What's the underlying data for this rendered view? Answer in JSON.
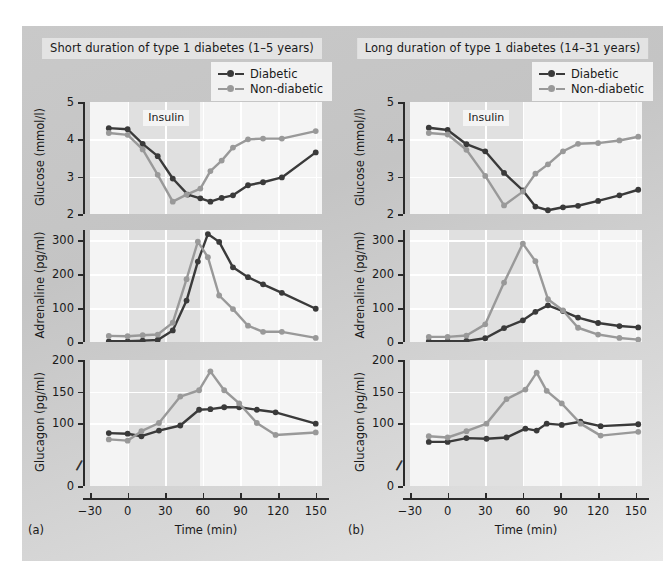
{
  "figure": {
    "background_color": "#c8c8c8",
    "plot_background": "#f4f4f4",
    "insulin_band_color": "#e0e0e0",
    "diabetic_color": "#3a3a3a",
    "nondiabetic_color": "#999999"
  },
  "panels": [
    {
      "letter": "(a)",
      "title": "Short duration of type 1 diabetes (1–5 years)",
      "legend": [
        {
          "label": "Diabetic",
          "color": "#3a3a3a",
          "name": "diabetic"
        },
        {
          "label": "Non-diabetic",
          "color": "#999999",
          "name": "non-diabetic"
        }
      ],
      "insulin_label": "Insulin",
      "xlabel": "Time (min)",
      "xticks": [
        -30,
        0,
        30,
        60,
        90,
        120,
        150
      ]
    },
    {
      "letter": "(b)",
      "title": "Long duration of type 1 diabetes (14–31 years)",
      "legend": [
        {
          "label": "Diabetic",
          "color": "#3a3a3a",
          "name": "diabetic"
        },
        {
          "label": "Non-diabetic",
          "color": "#999999",
          "name": "non-diabetic"
        }
      ],
      "insulin_label": "Insulin",
      "xlabel": "Time (min)",
      "xticks": [
        -30,
        0,
        30,
        60,
        90,
        120,
        150
      ]
    }
  ],
  "chart_data": [
    {
      "id": "a-glucose",
      "panel": "(a)",
      "type": "line",
      "title": "Short duration of type 1 diabetes (1–5 years)",
      "ylabel": "Glucose (mmol/l)",
      "xlabel": "Time (min)",
      "ylim": [
        2,
        5
      ],
      "yticks": [
        2,
        3,
        4,
        5
      ],
      "xlim": [
        -30,
        155
      ],
      "xticks": [
        -30,
        0,
        30,
        60,
        90,
        120,
        150
      ],
      "grid": true,
      "legend_position": "top-right",
      "insulin_window": [
        0,
        58
      ],
      "series": [
        {
          "name": "Diabetic",
          "color": "#3a3a3a",
          "x": [
            -15,
            0,
            12,
            24,
            36,
            48,
            58,
            66,
            75,
            84,
            96,
            108,
            123,
            150
          ],
          "values": [
            4.3,
            4.27,
            3.88,
            3.55,
            2.95,
            2.52,
            2.42,
            2.33,
            2.43,
            2.5,
            2.77,
            2.85,
            2.98,
            3.65
          ]
        },
        {
          "name": "Non-diabetic",
          "color": "#999999",
          "x": [
            -15,
            0,
            12,
            24,
            36,
            47,
            58,
            66,
            75,
            84,
            96,
            108,
            123,
            150
          ],
          "values": [
            4.17,
            4.12,
            3.73,
            3.05,
            2.33,
            2.52,
            2.68,
            3.15,
            3.43,
            3.78,
            4.0,
            4.02,
            4.02,
            4.22
          ]
        }
      ]
    },
    {
      "id": "a-adrenaline",
      "panel": "(a)",
      "type": "line",
      "ylabel": "Adrenaline (pg/ml)",
      "xlabel": "Time (min)",
      "ylim": [
        0,
        330
      ],
      "yticks": [
        0,
        100,
        200,
        300
      ],
      "xlim": [
        -30,
        155
      ],
      "xticks": [
        -30,
        0,
        30,
        60,
        90,
        120,
        150
      ],
      "grid": true,
      "insulin_window": [
        0,
        58
      ],
      "series": [
        {
          "name": "Diabetic",
          "color": "#3a3a3a",
          "x": [
            -15,
            0,
            12,
            24,
            36,
            47,
            56,
            64,
            73,
            84,
            96,
            108,
            123,
            150
          ],
          "values": [
            2,
            2,
            4,
            6,
            34,
            122,
            237,
            318,
            295,
            220,
            191,
            170,
            145,
            98
          ]
        },
        {
          "name": "Non-diabetic",
          "color": "#999999",
          "x": [
            -15,
            0,
            12,
            24,
            36,
            47,
            56,
            64,
            73,
            84,
            96,
            108,
            123,
            150
          ],
          "values": [
            18,
            17,
            20,
            22,
            57,
            185,
            296,
            250,
            137,
            97,
            48,
            30,
            30,
            12
          ]
        }
      ]
    },
    {
      "id": "a-glucagon",
      "panel": "(a)",
      "type": "line",
      "ylabel": "Glucagon (pg/ml)",
      "xlabel": "Time (min)",
      "ylim": [
        0,
        200
      ],
      "yticks": [
        0,
        100,
        150,
        200
      ],
      "axis_break": "between 0 and 100",
      "xlim": [
        -30,
        155
      ],
      "xticks": [
        -30,
        0,
        30,
        60,
        90,
        120,
        150
      ],
      "grid": true,
      "insulin_window": [
        0,
        58
      ],
      "series": [
        {
          "name": "Diabetic",
          "color": "#3a3a3a",
          "x": [
            -15,
            0,
            11,
            25,
            42,
            57,
            66,
            77,
            89,
            103,
            118,
            150
          ],
          "values": [
            84,
            83,
            79,
            88,
            96,
            121,
            122,
            125,
            125,
            121,
            117,
            99
          ]
        },
        {
          "name": "Non-diabetic",
          "color": "#999999",
          "x": [
            -15,
            0,
            11,
            25,
            42,
            57,
            66,
            77,
            89,
            103,
            118,
            150
          ],
          "values": [
            74,
            72,
            87,
            100,
            142,
            152,
            182,
            152,
            131,
            100,
            81,
            85
          ]
        }
      ]
    },
    {
      "id": "b-glucose",
      "panel": "(b)",
      "type": "line",
      "title": "Long duration of type 1 diabetes (14–31 years)",
      "ylabel": "Glucose (mmol/l)",
      "xlabel": "Time (min)",
      "ylim": [
        2,
        5
      ],
      "yticks": [
        2,
        3,
        4,
        5
      ],
      "xlim": [
        -30,
        155
      ],
      "xticks": [
        -30,
        0,
        30,
        60,
        90,
        120,
        150
      ],
      "grid": true,
      "legend_position": "top-right",
      "insulin_window": [
        0,
        60
      ],
      "series": [
        {
          "name": "Diabetic",
          "color": "#3a3a3a",
          "x": [
            -15,
            0,
            15,
            30,
            45,
            60,
            70,
            80,
            92,
            104,
            120,
            137,
            152
          ],
          "values": [
            4.31,
            4.25,
            3.87,
            3.68,
            3.1,
            2.63,
            2.2,
            2.1,
            2.18,
            2.22,
            2.35,
            2.5,
            2.65
          ]
        },
        {
          "name": "Non-diabetic",
          "color": "#999999",
          "x": [
            -15,
            0,
            15,
            30,
            45,
            60,
            70,
            80,
            92,
            104,
            120,
            137,
            152
          ],
          "values": [
            4.17,
            4.13,
            3.72,
            3.02,
            2.23,
            2.6,
            3.08,
            3.33,
            3.68,
            3.88,
            3.9,
            3.97,
            4.07
          ]
        }
      ]
    },
    {
      "id": "b-adrenaline",
      "panel": "(b)",
      "type": "line",
      "ylabel": "Adrenaline (pg/ml)",
      "xlabel": "Time (min)",
      "ylim": [
        0,
        330
      ],
      "yticks": [
        0,
        100,
        200,
        300
      ],
      "xlim": [
        -30,
        155
      ],
      "xticks": [
        -30,
        0,
        30,
        60,
        90,
        120,
        150
      ],
      "grid": true,
      "insulin_window": [
        0,
        60
      ],
      "series": [
        {
          "name": "Diabetic",
          "color": "#3a3a3a",
          "x": [
            -15,
            0,
            15,
            30,
            45,
            60,
            70,
            80,
            92,
            104,
            120,
            137,
            152
          ],
          "values": [
            2,
            2,
            3,
            11,
            41,
            64,
            89,
            108,
            91,
            72,
            56,
            47,
            43
          ]
        },
        {
          "name": "Non-diabetic",
          "color": "#999999",
          "x": [
            -15,
            0,
            15,
            30,
            45,
            60,
            70,
            80,
            92,
            104,
            120,
            137,
            152
          ],
          "values": [
            15,
            15,
            19,
            52,
            175,
            290,
            238,
            126,
            93,
            42,
            22,
            12,
            7
          ]
        }
      ]
    },
    {
      "id": "b-glucagon",
      "panel": "(b)",
      "type": "line",
      "ylabel": "Glucagon (pg/ml)",
      "xlabel": "Time (min)",
      "ylim": [
        0,
        200
      ],
      "yticks": [
        0,
        100,
        150,
        200
      ],
      "axis_break": "between 0 and 100",
      "xlim": [
        -30,
        155
      ],
      "xticks": [
        -30,
        0,
        30,
        60,
        90,
        120,
        150
      ],
      "grid": true,
      "insulin_window": [
        0,
        60
      ],
      "series": [
        {
          "name": "Diabetic",
          "color": "#3a3a3a",
          "x": [
            -15,
            0,
            15,
            31,
            47,
            62,
            71,
            79,
            91,
            106,
            122,
            152
          ],
          "values": [
            70,
            70,
            76,
            75,
            77,
            91,
            88,
            99,
            97,
            102,
            95,
            98
          ]
        },
        {
          "name": "Non-diabetic",
          "color": "#999999",
          "x": [
            -15,
            0,
            15,
            31,
            47,
            62,
            71,
            79,
            91,
            106,
            122,
            152
          ],
          "values": [
            79,
            77,
            87,
            99,
            138,
            153,
            180,
            151,
            131,
            99,
            80,
            86
          ]
        }
      ]
    }
  ]
}
